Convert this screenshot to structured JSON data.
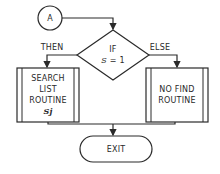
{
  "diagram": {
    "type": "flowchart",
    "stroke_color": "#2a2a2a",
    "background": "#ffffff",
    "connector": {
      "label": "A"
    },
    "decision": {
      "line1": "IF",
      "line2_var": "S",
      "line2_rest": " = 1"
    },
    "branches": {
      "then_label": "THEN",
      "else_label": "ELSE"
    },
    "then_process": {
      "line1": "SEARCH",
      "line2": "LIST",
      "line3": "ROUTINE",
      "line4": "Sj"
    },
    "else_process": {
      "line1": "NO FIND",
      "line2": "ROUTINE"
    },
    "terminator": {
      "label": "EXIT"
    }
  }
}
